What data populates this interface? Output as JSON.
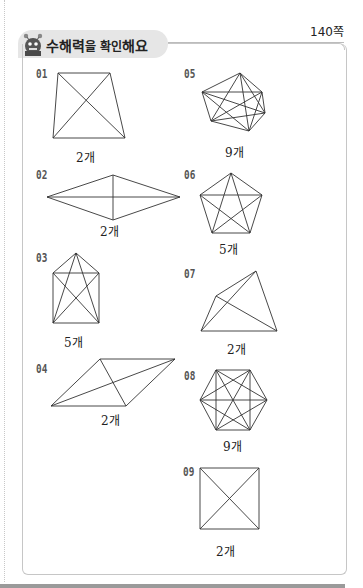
{
  "header": {
    "title_parts": [
      "수해력",
      "을 ",
      "확인",
      "해요"
    ],
    "page_number": "140쪽",
    "mascot_icon": "monster-mascot-icon"
  },
  "problems": [
    {
      "number": "01",
      "answer": "2개",
      "shape": "trapezoid",
      "vertices": [
        [
          58,
          73
        ],
        [
          110,
          73
        ],
        [
          125,
          138
        ],
        [
          53,
          138
        ]
      ]
    },
    {
      "number": "02",
      "answer": "2개",
      "shape": "rhombus",
      "vertices": [
        [
          47,
          197
        ],
        [
          113,
          175
        ],
        [
          180,
          197
        ],
        [
          113,
          220
        ]
      ]
    },
    {
      "number": "03",
      "answer": "5개",
      "shape": "pentagon-house",
      "vertices": [
        [
          76,
          253
        ],
        [
          99,
          273
        ],
        [
          99,
          323
        ],
        [
          53,
          323
        ],
        [
          53,
          273
        ]
      ]
    },
    {
      "number": "04",
      "answer": "2개",
      "shape": "parallelogram",
      "vertices": [
        [
          100,
          359
        ],
        [
          175,
          359
        ],
        [
          126,
          406
        ],
        [
          51,
          406
        ]
      ]
    },
    {
      "number": "05",
      "answer": "9개",
      "shape": "irregular-hexagon",
      "vertices": [
        [
          240,
          73
        ],
        [
          262,
          92
        ],
        [
          265,
          113
        ],
        [
          249,
          131
        ],
        [
          211,
          121
        ],
        [
          202,
          92
        ]
      ]
    },
    {
      "number": "06",
      "answer": "5개",
      "shape": "regular-pentagon",
      "vertices": [
        [
          231,
          173
        ],
        [
          262,
          195
        ],
        [
          250,
          233
        ],
        [
          212,
          233
        ],
        [
          200,
          195
        ]
      ]
    },
    {
      "number": "07",
      "answer": "2개",
      "shape": "irregular-quadrilateral",
      "vertices": [
        [
          256,
          271
        ],
        [
          277,
          331
        ],
        [
          201,
          331
        ],
        [
          216,
          296
        ]
      ]
    },
    {
      "number": "08",
      "answer": "9개",
      "shape": "regular-hexagon",
      "vertices": [
        [
          216,
          370
        ],
        [
          250,
          370
        ],
        [
          267,
          400
        ],
        [
          250,
          430
        ],
        [
          216,
          430
        ],
        [
          200,
          400
        ]
      ]
    },
    {
      "number": "09",
      "answer": "2개",
      "shape": "square",
      "vertices": [
        [
          200,
          468
        ],
        [
          259,
          468
        ],
        [
          259,
          529
        ],
        [
          200,
          529
        ]
      ]
    }
  ]
}
